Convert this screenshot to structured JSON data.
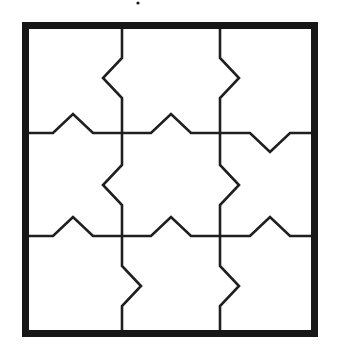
{
  "figure": {
    "kind": "line-diagram",
    "background_color": "#ffffff",
    "ink_color": "#1a1a1a",
    "canvas": {
      "width": 339,
      "height": 354
    }
  },
  "frame": {
    "name": "outer-border",
    "x": 22,
    "y": 22,
    "width": 296,
    "height": 315,
    "stroke_width": 7,
    "stroke_color": "#171717"
  },
  "grid": {
    "rows": 3,
    "columns": 3,
    "vertical_line_x": [
      122,
      220
    ],
    "horizontal_line_y": [
      133,
      236
    ],
    "cell_stroke_width": 2.6,
    "cell_stroke_color": "#1f1f1f",
    "zigzag": {
      "amplitude": 19,
      "half_span": 20,
      "description": "each interior edge carries one triangular notch/tab at its midpoint"
    }
  },
  "vertical_edges": [
    {
      "name": "vertical-edge-left-row-1",
      "x": 122,
      "from_y": 22,
      "to_y": 133,
      "tab_center_y": 78,
      "tab_direction": "left",
      "tip_x": 103
    },
    {
      "name": "vertical-edge-left-row-2",
      "x": 122,
      "from_y": 133,
      "to_y": 236,
      "tab_center_y": 185,
      "tab_direction": "left",
      "tip_x": 103
    },
    {
      "name": "vertical-edge-left-row-3",
      "x": 122,
      "from_y": 236,
      "to_y": 337,
      "tab_center_y": 286,
      "tab_direction": "right",
      "tip_x": 141
    },
    {
      "name": "vertical-edge-right-row-1",
      "x": 220,
      "from_y": 22,
      "to_y": 133,
      "tab_center_y": 78,
      "tab_direction": "right",
      "tip_x": 239
    },
    {
      "name": "vertical-edge-right-row-2",
      "x": 220,
      "from_y": 133,
      "to_y": 236,
      "tab_center_y": 185,
      "tab_direction": "right",
      "tip_x": 239
    },
    {
      "name": "vertical-edge-right-row-3",
      "x": 220,
      "from_y": 236,
      "to_y": 337,
      "tab_center_y": 286,
      "tab_direction": "right",
      "tip_x": 239
    }
  ],
  "horizontal_edges": [
    {
      "name": "horizontal-edge-top-col-1",
      "y": 133,
      "from_x": 22,
      "to_x": 122,
      "tab_center_x": 73,
      "tab_direction": "up",
      "tip_y": 114
    },
    {
      "name": "horizontal-edge-top-col-2",
      "y": 133,
      "from_x": 122,
      "to_x": 220,
      "tab_center_x": 171,
      "tab_direction": "up",
      "tip_y": 114
    },
    {
      "name": "horizontal-edge-top-col-3",
      "y": 133,
      "from_x": 220,
      "to_x": 318,
      "tab_center_x": 270,
      "tab_direction": "down",
      "tip_y": 152
    },
    {
      "name": "horizontal-edge-bottom-col-1",
      "y": 236,
      "from_x": 22,
      "to_x": 122,
      "tab_center_x": 73,
      "tab_direction": "up",
      "tip_y": 217
    },
    {
      "name": "horizontal-edge-bottom-col-2",
      "y": 236,
      "from_x": 122,
      "to_x": 220,
      "tab_center_x": 171,
      "tab_direction": "up",
      "tip_y": 217
    },
    {
      "name": "horizontal-edge-bottom-col-3",
      "y": 236,
      "from_x": 220,
      "to_x": 318,
      "tab_center_x": 270,
      "tab_direction": "up",
      "tip_y": 217
    }
  ],
  "artifacts": [
    {
      "name": "scan-speck",
      "x": 138,
      "y": 3,
      "radius": 1.6
    }
  ]
}
